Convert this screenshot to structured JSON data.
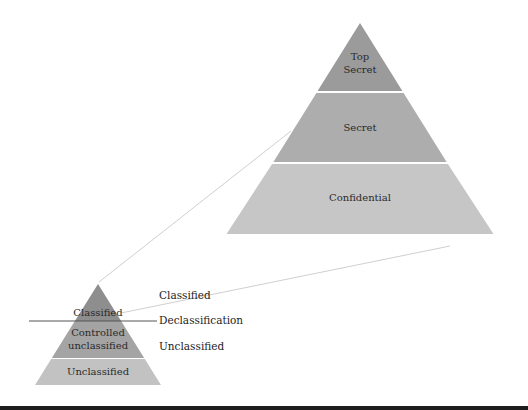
{
  "large_pyramid": {
    "levels": [
      {
        "label_line1": "Top",
        "label_line2": "Secret",
        "color": "#9b9b9b"
      },
      {
        "label": "Secret",
        "color": "#adadad"
      },
      {
        "label": "Confidential",
        "color": "#c6c6c6"
      }
    ]
  },
  "small_pyramid": {
    "levels": [
      {
        "label": "Classified",
        "color": "#8e8e8e"
      },
      {
        "label_line1": "Controlled",
        "label_line2": "unclassified",
        "color": "#a4a4a4"
      },
      {
        "label": "Unclassified",
        "color": "#c2c2c2"
      }
    ]
  },
  "side_labels": {
    "classified": "Classified",
    "declassification": "Declassification",
    "unclassified": "Unclassified"
  }
}
